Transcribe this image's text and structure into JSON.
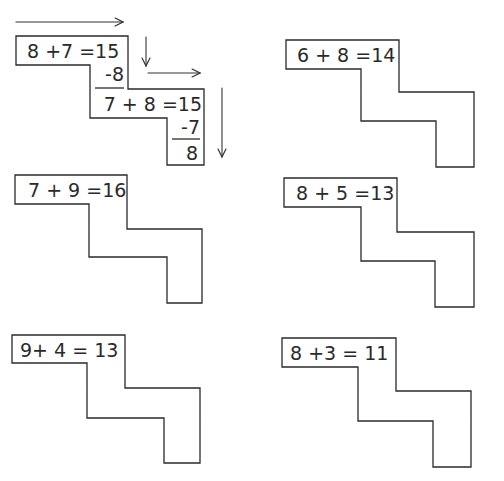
{
  "worksheet": {
    "example": {
      "first_equation": "8 +7 =15",
      "subtract_first": "-8",
      "second_equation": "7 + 8 =15",
      "subtract_second": "-7",
      "result": "8",
      "arrows": [
        "right",
        "down",
        "right",
        "down"
      ]
    },
    "problems": [
      {
        "equation": "6 + 8 =14"
      },
      {
        "equation": "7 + 9 =16"
      },
      {
        "equation": "8 + 5 =13"
      },
      {
        "equation": "9+ 4 = 13"
      },
      {
        "equation": "8 +3 = 11"
      }
    ]
  },
  "colors": {
    "ink": "#2a2a2a",
    "paper": "#ffffff"
  }
}
